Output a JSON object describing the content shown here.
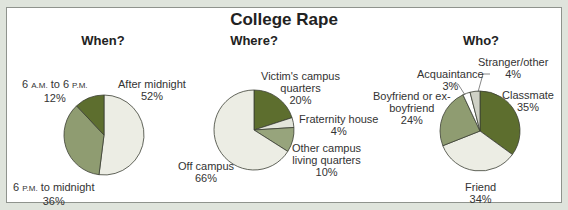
{
  "chart_data": [
    {
      "type": "pie",
      "title": "When?",
      "categories": [
        "After midnight",
        "6 P.M. to midnight",
        "6 A.M. to 6 P.M."
      ],
      "values": [
        52,
        36,
        12
      ],
      "colors": [
        "#ecede4",
        "#8f9c71",
        "#5d6e2e"
      ]
    },
    {
      "type": "pie",
      "title": "Where?",
      "categories": [
        "Victim's campus quarters",
        "Fraternity house",
        "Other campus living quarters",
        "Off campus"
      ],
      "values": [
        20,
        4,
        10,
        66
      ],
      "colors": [
        "#5d6e2e",
        "#e3e5da",
        "#97a47c",
        "#ecede4"
      ]
    },
    {
      "type": "pie",
      "title": "Who?",
      "categories": [
        "Classmate",
        "Friend",
        "Boyfriend or ex-boyfriend",
        "Acquaintance",
        "Stranger/other"
      ],
      "values": [
        35,
        34,
        24,
        3,
        4
      ],
      "colors": [
        "#5d6e2e",
        "#ecede4",
        "#8f9c71",
        "#ffffff",
        "#cfd1c6"
      ]
    }
  ],
  "figure": {
    "title": "College Rape"
  },
  "labels": {
    "when": {
      "day": {
        "line1a": "6 ",
        "am": "A.M.",
        "line1b": " to 6 ",
        "pm": "P.M.",
        "pct": "12%"
      },
      "after": {
        "line1": "After midnight",
        "pct": "52%"
      },
      "evening": {
        "line1a": "6 ",
        "pm": "P.M.",
        "line1b": " to midnight",
        "pct": "36%"
      }
    },
    "where": {
      "victim": {
        "line1": "Victim's campus",
        "line2": "quarters",
        "pct": "20%"
      },
      "frat": {
        "line1": "Fraternity house",
        "pct": "4%"
      },
      "other": {
        "line1": "Other campus",
        "line2": "living quarters",
        "pct": "10%"
      },
      "off": {
        "line1": "Off campus",
        "pct": "66%"
      }
    },
    "who": {
      "stranger": {
        "line1": "Stranger/other",
        "pct": "4%"
      },
      "acq": {
        "line1": "Acquaintance",
        "pct": "3%"
      },
      "boy": {
        "line1": "Boyfriend or ex-",
        "line2": "boyfriend",
        "pct": "24%"
      },
      "class": {
        "line1": "Classmate",
        "pct": "35%"
      },
      "friend": {
        "line1": "Friend",
        "pct": "34%"
      }
    }
  }
}
